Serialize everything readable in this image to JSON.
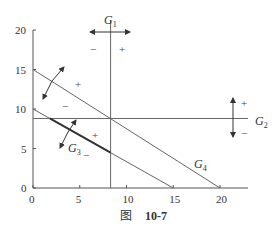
{
  "figure": {
    "caption_prefix": "图",
    "caption_number": "10-7",
    "x_ticks": [
      "0",
      "5",
      "10",
      "15",
      "20"
    ],
    "y_ticks": [
      "0",
      "5",
      "10",
      "15",
      "20"
    ],
    "x_tick_values": [
      0,
      5,
      10,
      15,
      20
    ],
    "y_tick_values": [
      0,
      5,
      10,
      15,
      20
    ],
    "xlim": [
      0,
      23
    ],
    "ylim": [
      0,
      20
    ],
    "lines": [
      {
        "id": "G1",
        "label": "G",
        "sub": "1",
        "type": "vertical",
        "x": 8.3,
        "plus_side": "right",
        "minus_side": "left"
      },
      {
        "id": "G2",
        "label": "G",
        "sub": "2",
        "type": "horizontal",
        "y": 8.8,
        "plus_side": "above",
        "minus_side": "below"
      },
      {
        "id": "G3",
        "label": "G",
        "sub": "3",
        "type": "segment",
        "from": [
          0,
          10
        ],
        "to": [
          15,
          0
        ],
        "plus_side": "above",
        "minus_side": "below"
      },
      {
        "id": "G4",
        "label": "G",
        "sub": "4",
        "type": "segment",
        "from": [
          0,
          15
        ],
        "to": [
          20,
          0
        ],
        "plus_side": "above",
        "minus_side": "below"
      }
    ],
    "signs": {
      "plus": "+",
      "minus": "−"
    }
  }
}
